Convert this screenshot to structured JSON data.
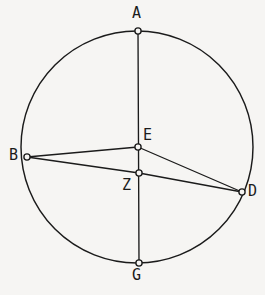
{
  "figure": {
    "background_color": "#f6f5f3",
    "stroke_color": "#1b1b1b",
    "circle": {
      "center_x": 137,
      "center_y": 147,
      "radius": 116
    },
    "points": [
      {
        "id": "A",
        "label": "A",
        "x": 138,
        "y": 31,
        "role": "top-of-circle"
      },
      {
        "id": "B",
        "label": "B",
        "x": 27,
        "y": 157,
        "role": "on-circle-left"
      },
      {
        "id": "E",
        "label": "E",
        "x": 138,
        "y": 147,
        "role": "on-vertical-diameter"
      },
      {
        "id": "Z",
        "label": "Z",
        "x": 139,
        "y": 173,
        "role": "on-vertical-diameter"
      },
      {
        "id": "D",
        "label": "D",
        "x": 242,
        "y": 192,
        "role": "on-circle-right"
      },
      {
        "id": "G",
        "label": "G",
        "x": 139,
        "y": 263,
        "role": "bottom-of-circle"
      }
    ],
    "segments": [
      {
        "id": "AG",
        "from": "A",
        "to": "G",
        "description": "vertical-diameter"
      },
      {
        "id": "BE",
        "from": "B",
        "to": "E",
        "description": "chord-b-to-e"
      },
      {
        "id": "ED",
        "from": "E",
        "to": "D",
        "description": "chord-e-to-d"
      },
      {
        "id": "BZ",
        "from": "B",
        "to": "Z",
        "description": "chord-b-to-z"
      },
      {
        "id": "ZD",
        "from": "Z",
        "to": "D",
        "description": "chord-z-to-d"
      }
    ]
  }
}
